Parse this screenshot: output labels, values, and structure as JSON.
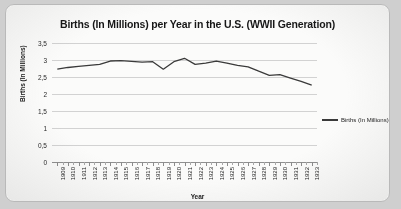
{
  "chart_data": {
    "type": "line",
    "title": "Births (In Millions) per Year in the U.S. (WWII Generation)",
    "xlabel": "Year",
    "ylabel": "Births (In Millions)",
    "ylim": [
      0,
      3.5
    ],
    "ytick_labels": [
      "3,5",
      "3",
      "2,5",
      "2",
      "1,5",
      "1",
      "0,5",
      "0"
    ],
    "ytick_values": [
      3.5,
      3,
      2.5,
      2,
      1.5,
      1,
      0.5,
      0
    ],
    "grid": true,
    "legend_position": "right",
    "decimal_separator": ",",
    "categories": [
      "1909",
      "1910",
      "1911",
      "1912",
      "1913",
      "1914",
      "1915",
      "1916",
      "1917",
      "1918",
      "1919",
      "1920",
      "1921",
      "1922",
      "1923",
      "1924",
      "1925",
      "1926",
      "1927",
      "1928",
      "1929",
      "1930",
      "1931",
      "1932",
      "1933"
    ],
    "series": [
      {
        "name": "Births (In Millions)",
        "color": "#3a3a3a",
        "values": [
          2.73,
          2.78,
          2.81,
          2.84,
          2.87,
          2.97,
          2.98,
          2.96,
          2.94,
          2.95,
          2.73,
          2.95,
          3.05,
          2.87,
          2.91,
          2.97,
          2.91,
          2.84,
          2.8,
          2.67,
          2.55,
          2.57,
          2.47,
          2.37,
          2.26
        ]
      }
    ]
  },
  "legend": {
    "entries": [
      {
        "label": "Births (In Millions)",
        "marker": "line-swatch"
      }
    ]
  }
}
